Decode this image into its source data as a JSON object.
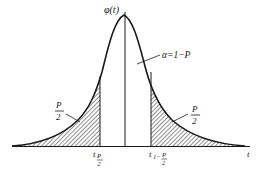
{
  "diagram": {
    "title": "",
    "y_axis_label": "φ(t)",
    "x_axis_label": "t",
    "center_region_label": "α=1−P",
    "left_tail_label": {
      "numerator": "P",
      "denominator": "2"
    },
    "right_tail_label": {
      "numerator": "P",
      "denominator": "2"
    },
    "left_critical_value": {
      "base": "t",
      "sub_numerator": "P",
      "sub_denominator": "2"
    },
    "right_critical_value": {
      "base": "t",
      "sub_prefix": "1−",
      "sub_numerator": "P",
      "sub_denominator": "2"
    },
    "colors": {
      "stroke": "#1a1a1a",
      "background": "#ffffff"
    }
  }
}
